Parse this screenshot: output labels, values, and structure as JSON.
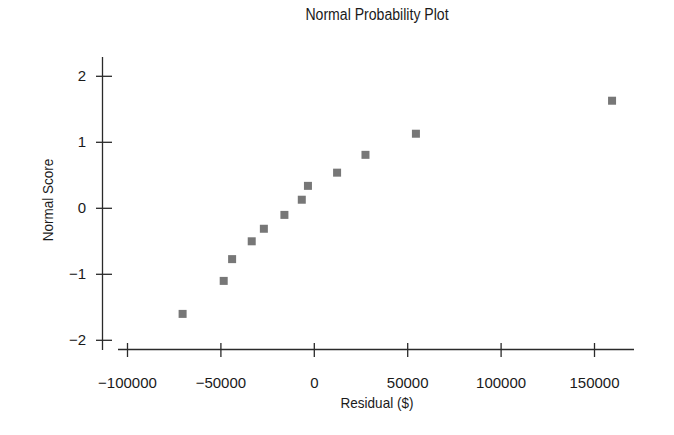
{
  "chart_data": {
    "type": "scatter",
    "title": "Normal Probability Plot",
    "xlabel": "Residual ($)",
    "ylabel": "Normal Score",
    "xlim": [
      -110000,
      170000
    ],
    "ylim": [
      -2.2,
      2.3
    ],
    "xticks": [
      -100000,
      -50000,
      0,
      50000,
      100000,
      150000
    ],
    "xtick_labels": [
      "−100000",
      "−50000",
      "0",
      "50000",
      "100000",
      "150000"
    ],
    "yticks": [
      -2,
      -1,
      0,
      1,
      2
    ],
    "ytick_labels": [
      "−2",
      "−1",
      "0",
      "1",
      "2"
    ],
    "grid": false,
    "legend": null,
    "marker": "square",
    "marker_color": "#777777",
    "points": [
      {
        "x": -70500,
        "y": -1.6
      },
      {
        "x": -48500,
        "y": -1.1
      },
      {
        "x": -44000,
        "y": -0.77
      },
      {
        "x": -33500,
        "y": -0.5
      },
      {
        "x": -27000,
        "y": -0.31
      },
      {
        "x": -16000,
        "y": -0.1
      },
      {
        "x": -6700,
        "y": 0.13
      },
      {
        "x": -3400,
        "y": 0.34
      },
      {
        "x": 12200,
        "y": 0.54
      },
      {
        "x": 27400,
        "y": 0.81
      },
      {
        "x": 54400,
        "y": 1.13
      },
      {
        "x": 159400,
        "y": 1.63
      }
    ]
  }
}
